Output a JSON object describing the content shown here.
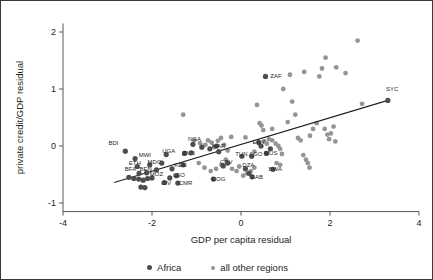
{
  "chart_data": {
    "type": "scatter",
    "title": "",
    "xlabel": "GDP per capita residual",
    "ylabel": "private credit/GDP residual",
    "xlim": [
      -4,
      4
    ],
    "ylim": [
      -1.15,
      2.15
    ],
    "xticks": [
      -4,
      -2,
      0,
      2,
      4
    ],
    "yticks": [
      -1,
      0,
      1,
      2
    ],
    "xtick_labels": [
      "-4",
      "-2",
      "0",
      "2",
      "4"
    ],
    "ytick_labels": [
      "-1",
      "0",
      "1",
      "2"
    ],
    "grid": false,
    "legend_position": "bottom",
    "colors": {
      "africa": "#4d4d4f",
      "other": "#939598",
      "fitline": "#231f20",
      "axis": "#58595b"
    },
    "series": [
      {
        "name": "Africa",
        "marker_color": "#4d4d4f",
        "points": [
          {
            "label": "BDI",
            "x": -2.6,
            "y": -0.09,
            "lx": -2.98,
            "ly": 0.02
          },
          {
            "label": "MWI",
            "x": -2.38,
            "y": -0.22,
            "lx": -2.3,
            "ly": -0.19
          },
          {
            "label": "ETH",
            "x": -2.33,
            "y": -0.36,
            "lx": -2.52,
            "ly": -0.33
          },
          {
            "label": "MDG",
            "x": -2.05,
            "y": -0.33,
            "lx": -2.1,
            "ly": -0.31
          },
          {
            "label": "BFA",
            "x": -2.29,
            "y": -0.48,
            "lx": -2.61,
            "ly": -0.44
          },
          {
            "label": "BEN",
            "x": -2.12,
            "y": -0.47,
            "lx": -2.28,
            "ly": -0.44
          },
          {
            "label": "MOZ",
            "x": -2.0,
            "y": -0.56,
            "lx": -2.05,
            "ly": -0.52
          },
          {
            "label": "CIV",
            "x": -1.72,
            "y": -0.64,
            "lx": -1.8,
            "ly": -0.68
          },
          {
            "label": "CMR",
            "x": -1.42,
            "y": -0.65,
            "lx": -1.4,
            "ly": -0.69
          },
          {
            "label": "LSO",
            "x": -1.45,
            "y": -0.52,
            "lx": -1.53,
            "ly": -0.55
          },
          {
            "label": "KEN",
            "x": -1.3,
            "y": -0.33,
            "lx": -1.5,
            "ly": -0.37
          },
          {
            "label": "UGA",
            "x": -1.68,
            "y": -0.15,
            "lx": -1.77,
            "ly": -0.13
          },
          {
            "label": "ZMB",
            "x": -1.27,
            "y": -0.13,
            "lx": -1.32,
            "ly": -0.16
          },
          {
            "label": "NGA",
            "x": -1.08,
            "y": 0.03,
            "lx": -1.19,
            "ly": 0.09
          },
          {
            "label": "MAR",
            "x": -0.55,
            "y": 0.0,
            "lx": -0.65,
            "ly": -0.04
          },
          {
            "label": "CPV",
            "x": -0.4,
            "y": -0.35,
            "lx": -0.47,
            "ly": -0.32
          },
          {
            "label": "COG",
            "x": -0.62,
            "y": -0.58,
            "lx": -0.66,
            "ly": -0.62
          },
          {
            "label": "TUN",
            "x": 0.02,
            "y": -0.18,
            "lx": -0.13,
            "ly": -0.18
          },
          {
            "label": "DZA",
            "x": 0.1,
            "y": -0.4,
            "lx": 0.03,
            "ly": -0.37
          },
          {
            "label": "GAB",
            "x": 0.25,
            "y": -0.54,
            "lx": 0.21,
            "ly": -0.58
          },
          {
            "label": "EGY",
            "x": 0.4,
            "y": 0.06,
            "lx": 0.26,
            "ly": 0.04
          },
          {
            "label": "AGO",
            "x": 0.24,
            "y": -0.18,
            "lx": 0.18,
            "ly": -0.18
          },
          {
            "label": "MUS",
            "x": 0.57,
            "y": -0.13,
            "lx": 0.52,
            "ly": -0.16
          },
          {
            "label": "BWA",
            "x": 0.72,
            "y": -0.41,
            "lx": 0.62,
            "ly": -0.43
          },
          {
            "label": "ZAF",
            "x": 0.55,
            "y": 1.22,
            "lx": 0.66,
            "ly": 1.2
          },
          {
            "label": "SYC",
            "x": 3.3,
            "y": 0.8,
            "lx": 3.26,
            "ly": 0.97
          },
          {
            "label": "",
            "x": -2.52,
            "y": -0.55,
            "lx": 0,
            "ly": 0
          },
          {
            "label": "",
            "x": -2.41,
            "y": -0.57,
            "lx": 0,
            "ly": 0
          },
          {
            "label": "",
            "x": -2.3,
            "y": -0.58,
            "lx": 0,
            "ly": 0
          },
          {
            "label": "",
            "x": -2.2,
            "y": -0.6,
            "lx": 0,
            "ly": 0
          },
          {
            "label": "",
            "x": -2.1,
            "y": -0.57,
            "lx": 0,
            "ly": 0
          },
          {
            "label": "",
            "x": -2.25,
            "y": -0.72,
            "lx": 0,
            "ly": 0
          },
          {
            "label": "",
            "x": -2.16,
            "y": -0.73,
            "lx": 0,
            "ly": 0
          },
          {
            "label": "",
            "x": -1.9,
            "y": -0.42,
            "lx": 0,
            "ly": 0
          },
          {
            "label": "",
            "x": -1.78,
            "y": -0.3,
            "lx": 0,
            "ly": 0
          },
          {
            "label": "",
            "x": -1.55,
            "y": -0.4,
            "lx": 0,
            "ly": 0
          },
          {
            "label": "",
            "x": -1.6,
            "y": -0.56,
            "lx": 0,
            "ly": 0
          },
          {
            "label": "",
            "x": -1.12,
            "y": -0.12,
            "lx": 0,
            "ly": 0
          },
          {
            "label": "",
            "x": -0.88,
            "y": -0.02,
            "lx": 0,
            "ly": 0
          },
          {
            "label": "",
            "x": -0.7,
            "y": -0.05,
            "lx": 0,
            "ly": 0
          },
          {
            "label": "",
            "x": -0.5,
            "y": -0.1,
            "lx": 0,
            "ly": 0
          },
          {
            "label": "",
            "x": -0.3,
            "y": -0.3,
            "lx": 0,
            "ly": 0
          },
          {
            "label": "",
            "x": 0.18,
            "y": -0.48,
            "lx": 0,
            "ly": 0
          },
          {
            "label": "",
            "x": 0.45,
            "y": 0.0,
            "lx": 0,
            "ly": 0
          },
          {
            "label": "",
            "x": 0.66,
            "y": -0.05,
            "lx": 0,
            "ly": 0
          }
        ]
      },
      {
        "name": "all other regions",
        "marker_color": "#939598",
        "points": [
          {
            "x": -1.3,
            "y": 0.55
          },
          {
            "x": -1.05,
            "y": 0.1
          },
          {
            "x": -0.92,
            "y": 0.05
          },
          {
            "x": -0.8,
            "y": 0.02
          },
          {
            "x": -0.74,
            "y": 0.1
          },
          {
            "x": -0.66,
            "y": 0.06
          },
          {
            "x": -0.6,
            "y": -0.02
          },
          {
            "x": -0.52,
            "y": 0.09
          },
          {
            "x": -0.45,
            "y": 0.14
          },
          {
            "x": -0.38,
            "y": 0.02
          },
          {
            "x": -0.3,
            "y": -0.08
          },
          {
            "x": -0.22,
            "y": 0.16
          },
          {
            "x": -0.34,
            "y": -0.24
          },
          {
            "x": -0.44,
            "y": -0.33
          },
          {
            "x": -0.56,
            "y": -0.4
          },
          {
            "x": -0.68,
            "y": -0.44
          },
          {
            "x": -0.82,
            "y": -0.38
          },
          {
            "x": -0.95,
            "y": -0.3
          },
          {
            "x": -0.2,
            "y": -0.4
          },
          {
            "x": -0.1,
            "y": -0.44
          },
          {
            "x": -0.04,
            "y": -0.36
          },
          {
            "x": 0.05,
            "y": -0.52
          },
          {
            "x": 0.14,
            "y": -0.48
          },
          {
            "x": 0.22,
            "y": -0.44
          },
          {
            "x": 0.3,
            "y": -0.38
          },
          {
            "x": 0.36,
            "y": 0.72
          },
          {
            "x": 0.42,
            "y": 0.4
          },
          {
            "x": 0.46,
            "y": 0.36
          },
          {
            "x": 0.5,
            "y": 0.28
          },
          {
            "x": 0.52,
            "y": 0.08
          },
          {
            "x": 0.58,
            "y": 0.04
          },
          {
            "x": 0.63,
            "y": 0.12
          },
          {
            "x": 0.7,
            "y": 0.1
          },
          {
            "x": 0.78,
            "y": 0.04
          },
          {
            "x": 0.84,
            "y": 0.0
          },
          {
            "x": 0.88,
            "y": -0.05
          },
          {
            "x": 0.92,
            "y": -0.14
          },
          {
            "x": 0.8,
            "y": -0.3
          },
          {
            "x": 0.88,
            "y": -0.33
          },
          {
            "x": 0.95,
            "y": 1.0
          },
          {
            "x": 1.1,
            "y": 1.25
          },
          {
            "x": 1.15,
            "y": 0.78
          },
          {
            "x": 1.22,
            "y": 0.55
          },
          {
            "x": 1.28,
            "y": 0.14
          },
          {
            "x": 1.34,
            "y": 0.1
          },
          {
            "x": 1.4,
            "y": -0.16
          },
          {
            "x": 1.46,
            "y": -0.24
          },
          {
            "x": 1.5,
            "y": -0.3
          },
          {
            "x": 1.54,
            "y": -0.38
          },
          {
            "x": 1.42,
            "y": 1.3
          },
          {
            "x": 1.55,
            "y": 0.18
          },
          {
            "x": 1.62,
            "y": 0.3
          },
          {
            "x": 1.7,
            "y": 0.4
          },
          {
            "x": 1.76,
            "y": 1.22
          },
          {
            "x": 1.82,
            "y": 1.36
          },
          {
            "x": 1.88,
            "y": 0.3
          },
          {
            "x": 1.94,
            "y": 0.2
          },
          {
            "x": 1.98,
            "y": 0.12
          },
          {
            "x": 2.02,
            "y": 0.22
          },
          {
            "x": 2.08,
            "y": 0.34
          },
          {
            "x": 2.12,
            "y": 0.08
          },
          {
            "x": 1.9,
            "y": 1.55
          },
          {
            "x": 2.14,
            "y": 1.38
          },
          {
            "x": 2.35,
            "y": 1.28
          },
          {
            "x": 2.62,
            "y": 1.85
          },
          {
            "x": 2.72,
            "y": 0.74
          },
          {
            "x": 0.3,
            "y": -0.1
          },
          {
            "x": 0.1,
            "y": 0.15
          },
          {
            "x": 0.7,
            "y": 0.3
          },
          {
            "x": 1.05,
            "y": 0.42
          }
        ]
      }
    ],
    "fitline": {
      "x0": -2.85,
      "y0": -0.64,
      "x1": 3.3,
      "y1": 0.8
    }
  },
  "legend": {
    "items": [
      {
        "label": "Africa",
        "marker": "dot-dark"
      },
      {
        "label": "all other regions",
        "marker": "dot-gray"
      }
    ]
  }
}
